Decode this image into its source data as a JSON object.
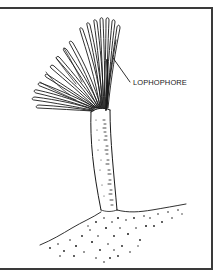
{
  "figure": {
    "labels": [
      {
        "text": "LOPHOPHORE",
        "points_to": "tentacle crown"
      }
    ],
    "parts": [
      "lophophore-tentacles",
      "stalk-tube",
      "sediment-mound",
      "leader-line",
      "frame"
    ],
    "colors": {
      "ink": "#1a1a1a",
      "frame": "#3a3a3a",
      "background": "#ffffff"
    }
  }
}
